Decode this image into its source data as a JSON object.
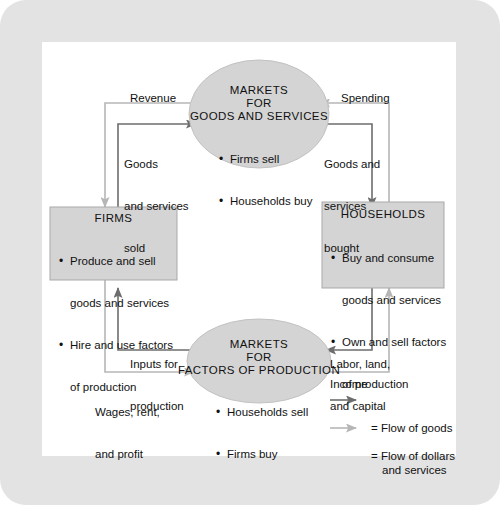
{
  "diagram": {
    "colors": {
      "frame": "#e3e3e3",
      "page": "#ffffff",
      "shape_fill": "#d4d4d4",
      "shape_stroke": "#9a9a9a",
      "goods_flow": "#6d6d6d",
      "dollar_flow": "#b6b6b6",
      "text": "#111111"
    },
    "nodes": {
      "markets_goods": {
        "shape": "ellipse",
        "title_lines": [
          "MARKETS",
          "FOR",
          "GOODS AND SERVICES"
        ],
        "bullets": [
          "Firms sell",
          "Households buy"
        ]
      },
      "firms": {
        "shape": "rect",
        "title_lines": [
          "FIRMS"
        ],
        "bullets": [
          "Produce and sell",
          "goods and services",
          "Hire and use factors",
          "of production"
        ]
      },
      "households": {
        "shape": "rect",
        "title_lines": [
          "HOUSEHOLDS"
        ],
        "bullets": [
          "Buy and consume",
          "goods and services",
          "Own and sell factors",
          "of production"
        ]
      },
      "markets_factors": {
        "shape": "ellipse",
        "title_lines": [
          "MARKETS",
          "FOR",
          "FACTORS OF PRODUCTION"
        ],
        "bullets": [
          "Households sell",
          "Firms buy"
        ]
      }
    },
    "flow_labels": {
      "revenue": "Revenue",
      "spending": "Spending",
      "goods_sold": [
        "Goods",
        "and services",
        "sold"
      ],
      "goods_bought": [
        "Goods and",
        "services",
        "bought"
      ],
      "inputs": [
        "Inputs for",
        "production"
      ],
      "labor": [
        "Labor, land,",
        "and capital"
      ],
      "wages": [
        "Wages, rent,",
        "and profit"
      ],
      "income": "Income"
    },
    "legend": {
      "items": [
        {
          "key": "goods",
          "color": "#6d6d6d",
          "lines": [
            "= Flow of goods",
            "and services"
          ]
        },
        {
          "key": "dollars",
          "color": "#b6b6b6",
          "lines": [
            "= Flow of dollars"
          ]
        }
      ]
    }
  }
}
